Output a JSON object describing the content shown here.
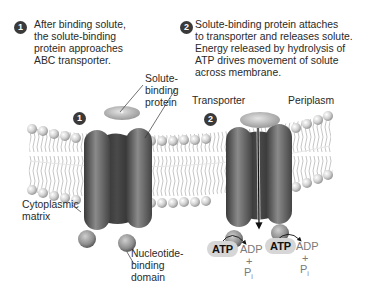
{
  "steps": [
    {
      "number": "1",
      "lines": [
        "After binding solute,",
        "the solute-binding",
        "protein approaches",
        "ABC transporter."
      ]
    },
    {
      "number": "2",
      "lines": [
        "Solute-binding protein attaches",
        "to transporter and releases solute.",
        "Energy released by hydrolysis of",
        "ATP drives movement of solute",
        "across membrane."
      ]
    }
  ],
  "labels": {
    "solute_binding_protein": [
      "Solute-",
      "binding",
      "protein"
    ],
    "transporter": "Transporter",
    "periplasm": "Periplasm",
    "cytoplasmic_matrix": [
      "Cytoplasmic",
      "matrix"
    ],
    "nucleotide_binding_domain": [
      "Nucleotide-",
      "binding",
      "domain"
    ]
  },
  "diagram_markers": {
    "transporter_1": "1",
    "transporter_2": "2"
  },
  "reactions": [
    {
      "reactant": "ATP",
      "product": "ADP",
      "plus": "+",
      "extra": "P",
      "subscript": "i"
    },
    {
      "reactant": "ATP",
      "product": "ADP",
      "plus": "+",
      "extra": "P",
      "subscript": "i"
    }
  ],
  "colors": {
    "badge": "#3a3a3a",
    "protein_dark": "#3c3c3c",
    "protein_mid": "#6e6e6e",
    "membrane": "#cfcfcf",
    "atp_bubble": "#d6d6d6",
    "product_text": "#7a7a7a"
  }
}
